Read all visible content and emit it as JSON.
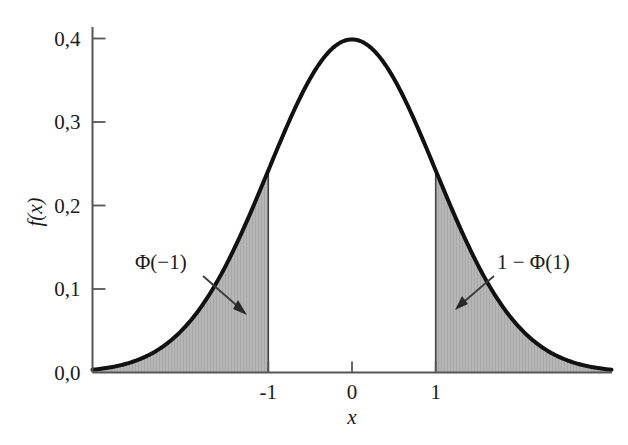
{
  "chart_data": {
    "type": "area",
    "title": "",
    "subtitle": "",
    "xlabel": "x",
    "ylabel": "f(x)",
    "xlim": [
      -3.1,
      3.1
    ],
    "ylim": [
      0.0,
      0.4
    ],
    "grid": false,
    "legend": null,
    "x_ticks": [
      "-1",
      "0",
      "1"
    ],
    "x_tick_values": [
      -1,
      0,
      1
    ],
    "y_ticks": [
      "0,0",
      "0,1",
      "0,2",
      "0,3",
      "0,4"
    ],
    "y_tick_values": [
      0.0,
      0.1,
      0.2,
      0.3,
      0.4
    ],
    "decimal_separator": ",",
    "series": [
      {
        "name": "standard normal pdf",
        "type": "line",
        "color": "#111111",
        "line_width": 4,
        "x": [
          -3.1,
          -3.0,
          -2.8,
          -2.6,
          -2.4,
          -2.2,
          -2.0,
          -1.8,
          -1.6,
          -1.4,
          -1.2,
          -1.0,
          -0.8,
          -0.6,
          -0.4,
          -0.2,
          0.0,
          0.2,
          0.4,
          0.6,
          0.8,
          1.0,
          1.2,
          1.4,
          1.6,
          1.8,
          2.0,
          2.2,
          2.4,
          2.6,
          2.8,
          3.0,
          3.1
        ],
        "y": [
          0.0033,
          0.0044,
          0.0079,
          0.0136,
          0.0224,
          0.0355,
          0.054,
          0.079,
          0.1109,
          0.1497,
          0.1942,
          0.242,
          0.2897,
          0.3332,
          0.3683,
          0.391,
          0.3989,
          0.391,
          0.3683,
          0.3332,
          0.2897,
          0.242,
          0.1942,
          0.1497,
          0.1109,
          0.079,
          0.054,
          0.0355,
          0.0224,
          0.0136,
          0.0079,
          0.0044,
          0.0033
        ]
      }
    ],
    "shaded_regions": [
      {
        "name": "left-tail",
        "label": "Φ(−1)",
        "x_from": -3.1,
        "x_to": -1.0,
        "fill": "#b4b4b4",
        "hatch": "vertical"
      },
      {
        "name": "right-tail",
        "label": "1 − Φ(1)",
        "x_from": 1.0,
        "x_to": 3.1,
        "fill": "#b4b4b4",
        "hatch": "vertical"
      }
    ],
    "vertical_lines": [
      -1,
      1
    ],
    "peak": {
      "x": 0,
      "y": 0.4
    },
    "annotations": [
      {
        "name": "left-tail-annotation",
        "text": "Φ(−1)",
        "text_x": -2.6,
        "text_y": 0.132,
        "arrow_to_x": -1.28,
        "arrow_to_y": 0.087
      },
      {
        "name": "right-tail-annotation",
        "text": "1 − Φ(1)",
        "text_x": 1.85,
        "text_y": 0.132,
        "arrow_to_x": 1.23,
        "arrow_to_y": 0.093
      }
    ]
  },
  "figure": {
    "axis_color": "#555555",
    "curve_color": "#111111",
    "shade_color": "#b4b4b4",
    "background": "#ffffff"
  }
}
